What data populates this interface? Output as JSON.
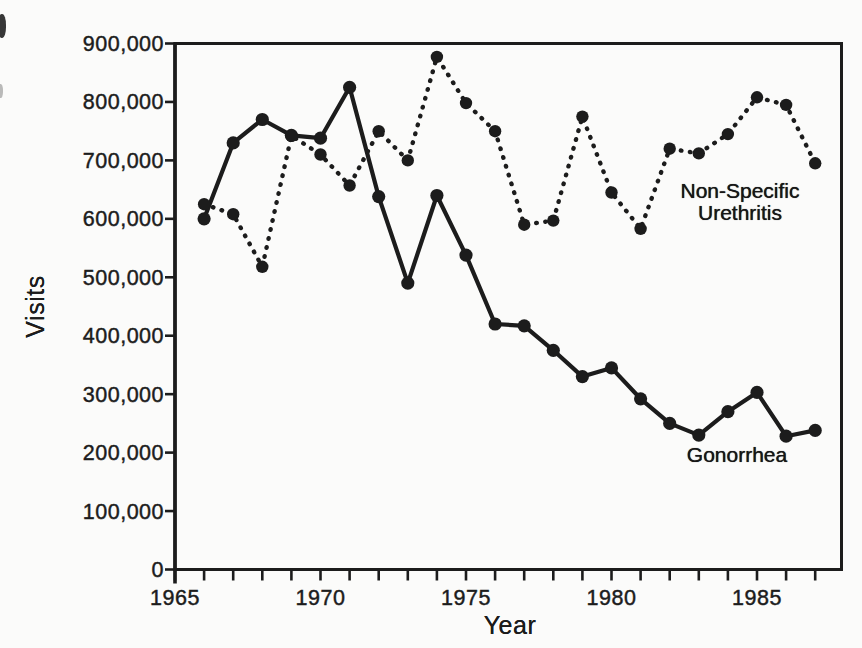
{
  "figure": {
    "background": "#fbfbfa",
    "ink_color": "#1c1c1c"
  },
  "chart_data": {
    "type": "line",
    "title": "",
    "xlabel": "Year",
    "ylabel": "Visits",
    "grid": false,
    "legend_position": "inline-annotations",
    "x_years": [
      1966,
      1967,
      1968,
      1969,
      1970,
      1971,
      1972,
      1973,
      1974,
      1975,
      1976,
      1977,
      1978,
      1979,
      1980,
      1981,
      1982,
      1983,
      1984,
      1985,
      1986,
      1987
    ],
    "x_axis": {
      "label": "Year",
      "tick_start": 1965,
      "tick_end": 1987,
      "tick_interval": 1,
      "range_shown": [
        1965,
        1988
      ],
      "labeled_ticks": [
        {
          "value": 1965,
          "label": "1965"
        },
        {
          "value": 1970,
          "label": "1970"
        },
        {
          "value": 1975,
          "label": "1975"
        },
        {
          "value": 1980,
          "label": "1980"
        },
        {
          "value": 1985,
          "label": "1985"
        }
      ]
    },
    "y_axis": {
      "label": "Visits",
      "min": 0,
      "max": 900000,
      "ticks": [
        {
          "value": 0,
          "label": "0"
        },
        {
          "value": 100000,
          "label": "100,000"
        },
        {
          "value": 200000,
          "label": "200,000"
        },
        {
          "value": 300000,
          "label": "300,000"
        },
        {
          "value": 400000,
          "label": "400,000"
        },
        {
          "value": 500000,
          "label": "500,000"
        },
        {
          "value": 600000,
          "label": "600,000"
        },
        {
          "value": 700000,
          "label": "700,000"
        },
        {
          "value": 800000,
          "label": "800,000"
        },
        {
          "value": 900000,
          "label": "900,000"
        }
      ]
    },
    "series": [
      {
        "name": "Gonorrhea",
        "line_style": "solid",
        "marker": "filled-circle",
        "annotation": {
          "lines": [
            "Gonorrhea"
          ]
        },
        "values": [
          600000,
          730000,
          770000,
          743000,
          738000,
          825000,
          638000,
          490000,
          640000,
          538000,
          420000,
          417000,
          375000,
          330000,
          345000,
          292000,
          250000,
          230000,
          270000,
          303000,
          228000,
          238000
        ]
      },
      {
        "name": "Non-Specific Urethritis",
        "line_style": "dotted",
        "marker": "filled-circle",
        "annotation": {
          "lines": [
            "Non-Specific",
            "Urethritis"
          ]
        },
        "values": [
          625000,
          608000,
          518000,
          742000,
          710000,
          657000,
          750000,
          700000,
          877000,
          798000,
          750000,
          590000,
          597000,
          775000,
          645000,
          583000,
          720000,
          712000,
          745000,
          808000,
          795000,
          695000
        ]
      }
    ]
  }
}
